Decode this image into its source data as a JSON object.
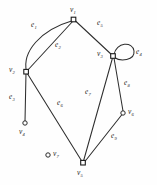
{
  "figure": {
    "kind": "undirected-multigraph-diagram",
    "background_color": "#fefefe",
    "stroke_color": "#2e2e2e",
    "width": 157,
    "height": 185
  },
  "vertices": [
    {
      "id": "v1",
      "label": "v",
      "sub": "1",
      "x": 74,
      "y": 20,
      "shape": "square",
      "label_x": 70,
      "label_y": 7
    },
    {
      "id": "v2",
      "label": "v",
      "sub": "2",
      "x": 26,
      "y": 72,
      "shape": "square",
      "label_x": 10,
      "label_y": 69
    },
    {
      "id": "v3",
      "label": "v",
      "sub": "3",
      "x": 113,
      "y": 56,
      "shape": "square",
      "label_x": 98,
      "label_y": 53
    },
    {
      "id": "v4",
      "label": "v",
      "sub": "4",
      "x": 25,
      "y": 123,
      "shape": "circle",
      "label_x": 20,
      "label_y": 127
    },
    {
      "id": "v5",
      "label": "v",
      "sub": "5",
      "x": 83,
      "y": 163,
      "shape": "square",
      "label_x": 78,
      "label_y": 168
    },
    {
      "id": "v6",
      "label": "v",
      "sub": "6",
      "x": 123,
      "y": 113,
      "shape": "circle",
      "label_x": 128,
      "label_y": 110
    },
    {
      "id": "v7",
      "label": "v",
      "sub": "7",
      "x": 48,
      "y": 155,
      "shape": "circle",
      "label_x": 53,
      "label_y": 152
    }
  ],
  "edges": [
    {
      "id": "e1",
      "label": "e",
      "sub": "1",
      "from": "v2",
      "to": "v1",
      "type": "curve",
      "label_x": 32,
      "label_y": 26
    },
    {
      "id": "e2",
      "label": "e",
      "sub": "2",
      "from": "v2",
      "to": "v1",
      "type": "line",
      "label_x": 56,
      "label_y": 46
    },
    {
      "id": "e3",
      "label": "e",
      "sub": "3",
      "from": "v2",
      "to": "v4",
      "type": "line",
      "label_x": 10,
      "label_y": 98
    },
    {
      "id": "e4",
      "label": "e",
      "sub": "4",
      "from": "v3",
      "to": "v3",
      "type": "loop",
      "label_x": 136,
      "label_y": 53
    },
    {
      "id": "e5",
      "label": "e",
      "sub": "5",
      "from": "v1",
      "to": "v3",
      "type": "line",
      "label_x": 98,
      "label_y": 24
    },
    {
      "id": "e6",
      "label": "e",
      "sub": "6",
      "from": "v2",
      "to": "v5",
      "type": "line",
      "label_x": 58,
      "label_y": 104
    },
    {
      "id": "e7",
      "label": "e",
      "sub": "7",
      "from": "v3",
      "to": "v5",
      "type": "line",
      "label_x": 86,
      "label_y": 93
    },
    {
      "id": "e8",
      "label": "e",
      "sub": "8",
      "from": "v3",
      "to": "v6",
      "type": "line",
      "label_x": 125,
      "label_y": 84
    },
    {
      "id": "e9",
      "label": "e",
      "sub": "9",
      "from": "v5",
      "to": "v6",
      "type": "line",
      "label_x": 112,
      "label_y": 137
    }
  ],
  "geometry": {
    "e1_path": "M 26.5 71.5 C 22 52 40 30 73 20.5",
    "e2_path": "M 26.5 71.5 L 73.5 20.5",
    "e3_path": "M 26 72.5 L 25 121.5",
    "e5_path": "M 75 20.5 L 112 55",
    "e6_path": "M 27 73 L 82 161.5",
    "e7_path": "M 112.5 58 L 83.5 161",
    "e8_path": "M 114 58 L 123 111",
    "e9_path": "M 84.5 162 L 122 114.5",
    "e4_loop_path": "M 114 54.5 C 116 42 133 41 134 51 C 135 61 120 61.5 114.5 57.5"
  }
}
